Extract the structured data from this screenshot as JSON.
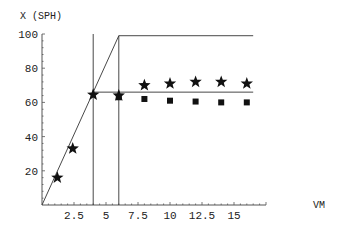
{
  "chart_data": {
    "type": "scatter",
    "title": "",
    "xlabel": "VM",
    "ylabel": "X (SPH)",
    "xlim": [
      0,
      17.5
    ],
    "ylim": [
      0,
      100
    ],
    "grid": false,
    "legend": null,
    "x_ticks": [
      2.5,
      5,
      7.5,
      10,
      12.5,
      15
    ],
    "x_tick_labels": [
      "2.5",
      "5",
      "7.5",
      "10",
      "12.5",
      "15"
    ],
    "y_ticks": [
      20,
      40,
      60,
      80,
      100
    ],
    "y_tick_labels": [
      "20",
      "40",
      "60",
      "80",
      "100"
    ],
    "series": [
      {
        "name": "stars",
        "marker": "star",
        "points": [
          [
            1.2,
            16
          ],
          [
            2.4,
            33
          ],
          [
            4,
            64.5
          ],
          [
            6,
            64
          ],
          [
            8,
            70
          ],
          [
            10,
            71
          ],
          [
            12,
            72
          ],
          [
            14,
            72
          ],
          [
            16,
            71
          ]
        ]
      },
      {
        "name": "squares",
        "marker": "square",
        "points": [
          [
            6,
            63
          ],
          [
            8,
            62
          ],
          [
            10,
            61
          ],
          [
            12,
            60.5
          ],
          [
            14,
            60
          ],
          [
            16,
            60
          ]
        ]
      }
    ],
    "lines": [
      {
        "name": "upper-bound",
        "points": [
          [
            0,
            0
          ],
          [
            6,
            99
          ],
          [
            16.5,
            99
          ]
        ]
      },
      {
        "name": "lower-bound",
        "points": [
          [
            4,
            66
          ],
          [
            16.5,
            66
          ]
        ]
      },
      {
        "name": "vertical-4",
        "points": [
          [
            4,
            0
          ],
          [
            4,
            100
          ]
        ]
      },
      {
        "name": "vertical-6",
        "points": [
          [
            6,
            0
          ],
          [
            6,
            99
          ]
        ]
      }
    ]
  },
  "colors": {
    "axis": "#555555",
    "line": "#333333",
    "marker": "#111111"
  }
}
